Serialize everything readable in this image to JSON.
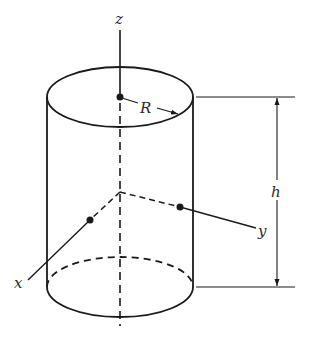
{
  "diagram": {
    "type": "cylinder-coordinate-diagram",
    "labels": {
      "z_axis": "z",
      "x_axis": "x",
      "y_axis": "y",
      "radius": "R",
      "height": "h"
    },
    "colors": {
      "stroke": "#1a1a1a",
      "background": "#ffffff"
    }
  }
}
